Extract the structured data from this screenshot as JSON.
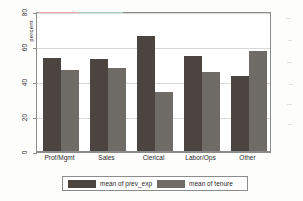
{
  "chart_data": {
    "type": "bar",
    "title": "",
    "xlabel": "",
    "ylabel": "percent",
    "categories": [
      "Prof/Mgmt",
      "Sales",
      "Clerical",
      "Labor/Ops",
      "Other"
    ],
    "series": [
      {
        "name": "mean of prev_exp",
        "color": "#4b4441",
        "values": [
          53,
          52.5,
          66,
          54.5,
          43
        ]
      },
      {
        "name": "mean of tenure",
        "color": "#6f6c68",
        "values": [
          46.5,
          47.5,
          33.5,
          45,
          57
        ]
      }
    ],
    "ylim": [
      0,
      80
    ],
    "yticks": [
      0,
      20,
      40,
      60,
      80
    ],
    "ytick_labels": [
      "0",
      "20",
      "40",
      "60",
      "80"
    ],
    "grid": "horizontal",
    "legend_position": "bottom"
  },
  "axes": {
    "y_title": "percent",
    "ticks": [
      {
        "label": "80",
        "value": 80
      },
      {
        "label": "60",
        "value": 60
      },
      {
        "label": "40",
        "value": 40
      },
      {
        "label": "20",
        "value": 20
      },
      {
        "label": "0",
        "value": 0
      }
    ]
  },
  "legend": {
    "entries": [
      {
        "label": "mean of prev_exp",
        "swatch": "dark-gray-swatch"
      },
      {
        "label": "mean of tenure",
        "swatch": "light-gray-swatch"
      }
    ]
  },
  "colors": {
    "series_1": "#4b4441",
    "series_2": "#6f6c68",
    "grid": "#d8d8d6",
    "frame": "#8c8c8c",
    "background": "#ffffff"
  }
}
